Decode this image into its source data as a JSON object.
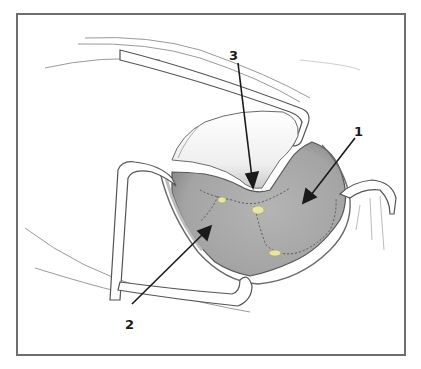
{
  "figure": {
    "type": "surgical-illustration",
    "border_color": "#6e6e6e",
    "tissue_color": "#a9a9a9",
    "fat_color": "#e8e6a0",
    "labels": [
      {
        "id": "1",
        "text": "1",
        "x": 355,
        "y": 126,
        "points_to": [
          303,
          203
        ]
      },
      {
        "id": "2",
        "text": "2",
        "x": 127,
        "y": 318,
        "points_to": [
          211,
          226
        ]
      },
      {
        "id": "3",
        "text": "3",
        "x": 234,
        "y": 48,
        "points_to": [
          254,
          188
        ]
      }
    ]
  }
}
